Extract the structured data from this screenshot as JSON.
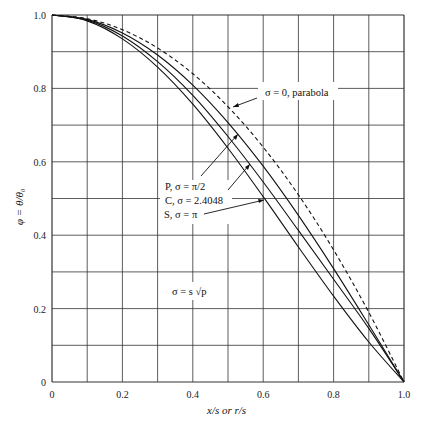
{
  "chart_data": {
    "type": "line",
    "title": "",
    "xlabel": "x/s  or  r/s",
    "ylabel": "φ = θ/θ₀",
    "xlim": [
      0,
      1.0
    ],
    "ylim": [
      0,
      1.0
    ],
    "grid": true,
    "x": [
      0,
      0.1,
      0.2,
      0.3,
      0.4,
      0.5,
      0.6,
      0.7,
      0.8,
      0.9,
      1.0
    ],
    "x_ticks": [
      "0",
      "0.2",
      "0.4",
      "0.6",
      "0.8",
      "1.0"
    ],
    "y_ticks": [
      "0",
      "0.2",
      "0.4",
      "0.6",
      "0.8",
      "1.0"
    ],
    "series": [
      {
        "name": "σ = 0, parabola",
        "style": "dashed",
        "values": [
          1.0,
          0.99,
          0.96,
          0.91,
          0.84,
          0.75,
          0.64,
          0.51,
          0.36,
          0.19,
          0.0
        ]
      },
      {
        "name": "P, σ = π/2",
        "style": "solid",
        "values": [
          1.0,
          0.988,
          0.951,
          0.891,
          0.809,
          0.707,
          0.588,
          0.454,
          0.309,
          0.156,
          0.0
        ]
      },
      {
        "name": "C, σ = 2.4048",
        "style": "solid",
        "values": [
          1.0,
          0.986,
          0.943,
          0.873,
          0.781,
          0.669,
          0.545,
          0.413,
          0.28,
          0.146,
          0.0
        ]
      },
      {
        "name": "S, σ = π",
        "style": "solid",
        "values": [
          1.0,
          0.984,
          0.935,
          0.858,
          0.757,
          0.637,
          0.505,
          0.368,
          0.234,
          0.109,
          0.0
        ]
      }
    ],
    "annotations": {
      "parabola": "σ = 0, parabola",
      "p_label": "P, σ = π/2",
      "c_label": "C, σ = 2.4048",
      "s_label": "S, σ = π",
      "definition": "σ = s √p"
    }
  }
}
